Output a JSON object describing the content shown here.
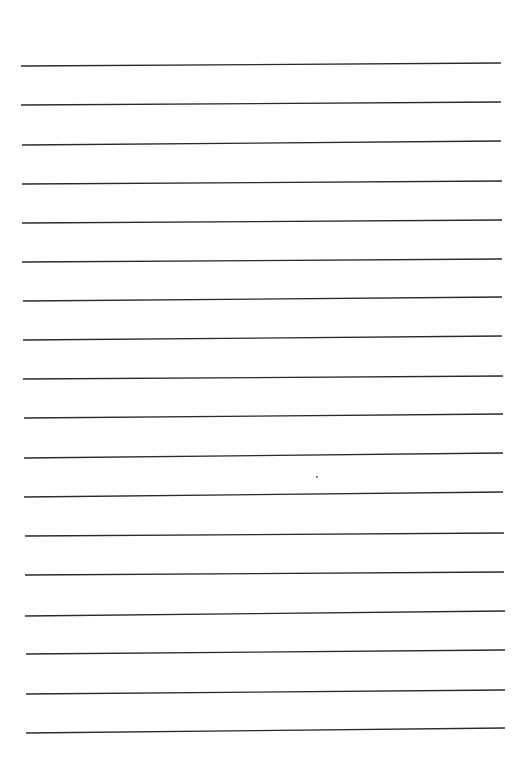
{
  "page": {
    "type": "lined-paper",
    "background": "#ffffff",
    "line_color": "#2a2a2a",
    "line_width": 1.3,
    "text": ""
  },
  "rules": [
    {
      "x1": 21,
      "y1": 66,
      "x2": 501,
      "y2": 63
    },
    {
      "x1": 21,
      "y1": 105,
      "x2": 501,
      "y2": 102
    },
    {
      "x1": 22,
      "y1": 145,
      "x2": 501,
      "y2": 141
    },
    {
      "x1": 22,
      "y1": 184,
      "x2": 502,
      "y2": 181
    },
    {
      "x1": 22,
      "y1": 223,
      "x2": 502,
      "y2": 220
    },
    {
      "x1": 22,
      "y1": 262,
      "x2": 502,
      "y2": 259
    },
    {
      "x1": 23,
      "y1": 301,
      "x2": 502,
      "y2": 297
    },
    {
      "x1": 23,
      "y1": 340,
      "x2": 502,
      "y2": 336
    },
    {
      "x1": 23,
      "y1": 379,
      "x2": 503,
      "y2": 376
    },
    {
      "x1": 24,
      "y1": 418,
      "x2": 503,
      "y2": 414
    },
    {
      "x1": 24,
      "y1": 458,
      "x2": 503,
      "y2": 453
    },
    {
      "x1": 24,
      "y1": 497,
      "x2": 503,
      "y2": 492
    },
    {
      "x1": 25,
      "y1": 536,
      "x2": 504,
      "y2": 533
    },
    {
      "x1": 25,
      "y1": 575,
      "x2": 504,
      "y2": 572
    },
    {
      "x1": 25,
      "y1": 616,
      "x2": 505,
      "y2": 611
    },
    {
      "x1": 26,
      "y1": 654,
      "x2": 505,
      "y2": 650
    },
    {
      "x1": 26,
      "y1": 694,
      "x2": 505,
      "y2": 690
    },
    {
      "x1": 26,
      "y1": 733,
      "x2": 505,
      "y2": 728
    }
  ],
  "marks": [
    {
      "x": 317,
      "y": 477,
      "r": 0.9,
      "color": "#555555"
    }
  ]
}
